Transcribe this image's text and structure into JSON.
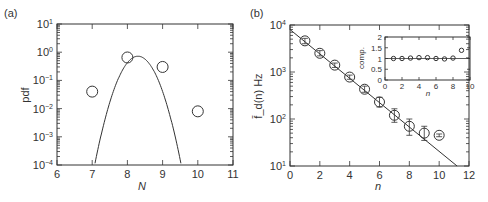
{
  "chart_data": [
    {
      "panel": "(a)",
      "type": "scatter",
      "title": "",
      "xlabel": "N",
      "ylabel": "pdf",
      "yscale": "log",
      "xlim": [
        6,
        11
      ],
      "ylim": [
        0.0001,
        10
      ],
      "x_ticks": [
        "6",
        "7",
        "8",
        "9",
        "10",
        "11"
      ],
      "y_ticks": [
        "10^-4",
        "10^-3",
        "10^-2",
        "10^-1",
        "10^0",
        "10^1"
      ],
      "series": [
        {
          "name": "data",
          "style": "open-circle",
          "x": [
            7,
            8,
            9,
            10
          ],
          "y": [
            0.04,
            0.65,
            0.3,
            0.008
          ]
        },
        {
          "name": "fit",
          "style": "line",
          "shape": "log-parabola",
          "peak_x": 8.3,
          "peak_y": 0.72,
          "curvature": 2.55
        }
      ],
      "grid": false,
      "legend": null
    },
    {
      "panel": "(b)",
      "type": "scatter",
      "title": "",
      "xlabel": "n",
      "ylabel": "f̄_d(n) Hz",
      "yscale": "log",
      "xlim": [
        0,
        12
      ],
      "ylim": [
        10,
        10000
      ],
      "x_ticks": [
        "0",
        "2",
        "4",
        "6",
        "8",
        "10",
        "12"
      ],
      "y_ticks": [
        "10^1",
        "10^2",
        "10^3",
        "10^4"
      ],
      "series": [
        {
          "name": "data",
          "style": "open-circle-errorbar",
          "x": [
            1,
            2,
            3,
            4,
            5,
            6,
            7,
            8,
            9,
            10
          ],
          "y": [
            4600,
            2500,
            1400,
            780,
            430,
            230,
            120,
            70,
            50,
            45
          ],
          "err_low": [
            4000,
            2200,
            1250,
            700,
            370,
            180,
            85,
            45,
            35,
            42
          ],
          "err_high": [
            5200,
            2850,
            1550,
            860,
            500,
            290,
            165,
            100,
            70,
            48
          ]
        },
        {
          "name": "fit",
          "style": "line",
          "x": [
            0,
            11.2
          ],
          "y": [
            8000,
            10
          ]
        }
      ],
      "grid": false,
      "legend": null,
      "inset": {
        "type": "scatter",
        "xlabel": "n",
        "ylabel": "comp.",
        "xlim": [
          0,
          10
        ],
        "ylim": [
          0,
          2
        ],
        "x_ticks": [
          "0",
          "2",
          "4",
          "6",
          "8",
          "10"
        ],
        "y_ticks": [
          "0",
          "0.5",
          "1",
          "1.5",
          "2"
        ],
        "reference_line_y": 1,
        "series": [
          {
            "name": "comp",
            "x": [
              1,
              2,
              3,
              4,
              5,
              6,
              7,
              8,
              9
            ],
            "y": [
              1.0,
              1.0,
              1.02,
              1.04,
              1.04,
              1.0,
              0.98,
              1.02,
              1.38
            ]
          }
        ]
      }
    }
  ],
  "labels": {
    "panel_a": "(a)",
    "panel_b": "(b)",
    "a_xlabel": "N",
    "a_ylabel": "pdf",
    "b_xlabel": "n",
    "b_ylabel": "f̄_d(n) Hz",
    "inset_xlabel": "n",
    "inset_ylabel": "comp."
  }
}
